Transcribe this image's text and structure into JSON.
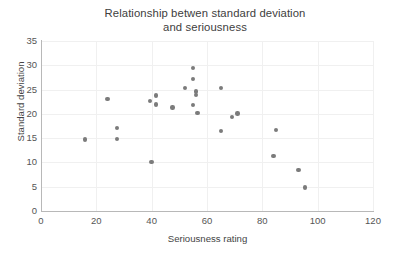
{
  "chart_data": {
    "type": "scatter",
    "title": "Relationship betwen standard deviation and seriousness",
    "title_line1": "Relationship betwen standard deviation",
    "title_line2": "and seriousness",
    "xlabel": "Seriousness rating",
    "ylabel": "Standard deviation",
    "xlim": [
      0,
      120
    ],
    "ylim": [
      0,
      35
    ],
    "xticks": [
      0,
      20,
      40,
      60,
      80,
      100,
      120
    ],
    "yticks": [
      0,
      5,
      10,
      15,
      20,
      25,
      30,
      35
    ],
    "grid": true,
    "legend": null,
    "marker_color": "#7b7b7b",
    "points": [
      {
        "x": 16,
        "y": 14.7
      },
      {
        "x": 24,
        "y": 23.0
      },
      {
        "x": 27.5,
        "y": 17.1
      },
      {
        "x": 27.5,
        "y": 14.8
      },
      {
        "x": 39.5,
        "y": 22.7
      },
      {
        "x": 41.5,
        "y": 23.8
      },
      {
        "x": 41.5,
        "y": 21.9
      },
      {
        "x": 40,
        "y": 10.1
      },
      {
        "x": 47.5,
        "y": 21.3
      },
      {
        "x": 52,
        "y": 25.3
      },
      {
        "x": 55,
        "y": 29.5
      },
      {
        "x": 55,
        "y": 27.2
      },
      {
        "x": 56,
        "y": 24.6
      },
      {
        "x": 56,
        "y": 23.9
      },
      {
        "x": 55,
        "y": 21.8
      },
      {
        "x": 56.5,
        "y": 20.2
      },
      {
        "x": 65,
        "y": 25.3
      },
      {
        "x": 65,
        "y": 16.5
      },
      {
        "x": 69,
        "y": 19.4
      },
      {
        "x": 71,
        "y": 20.1
      },
      {
        "x": 85,
        "y": 16.7
      },
      {
        "x": 84,
        "y": 11.3
      },
      {
        "x": 93,
        "y": 8.5
      },
      {
        "x": 95.5,
        "y": 4.8
      }
    ]
  }
}
